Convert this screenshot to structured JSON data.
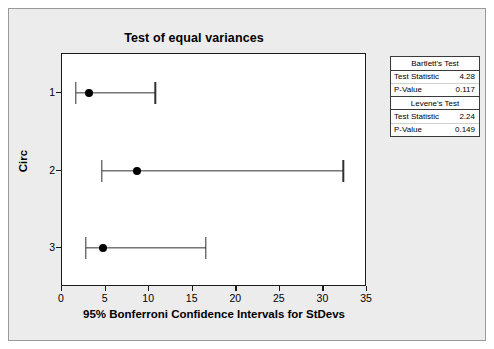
{
  "figure": {
    "title": "Test of equal variances",
    "background_color": "#ececec",
    "plot_background_color": "#ffffff"
  },
  "axes": {
    "x_title": "95% Bonferroni Confidence Intervals for StDevs",
    "y_title": "Circ",
    "x_ticks": [
      "0",
      "5",
      "10",
      "15",
      "20",
      "25",
      "30",
      "35"
    ],
    "y_ticks": [
      "1",
      "2",
      "3"
    ]
  },
  "stats": {
    "bartlett": {
      "heading": "Bartlett's Test",
      "statistic_label": "Test Statistic",
      "statistic_value": "4.28",
      "pvalue_label": "P-Value",
      "pvalue_value": "0.117"
    },
    "levene": {
      "heading": "Levene's Test",
      "statistic_label": "Test Statistic",
      "statistic_value": "2.24",
      "pvalue_label": "P-Value",
      "pvalue_value": "0.149"
    }
  },
  "chart_data": {
    "type": "scatter",
    "subtype": "interval-plot-confidence-intervals",
    "title": "Test of equal variances",
    "xlabel": "95% Bonferroni Confidence Intervals for StDevs",
    "ylabel": "Circ",
    "xlim": [
      0,
      35
    ],
    "xticks": [
      0,
      5,
      10,
      15,
      20,
      25,
      30,
      35
    ],
    "grid": false,
    "legend": null,
    "categories": [
      "1",
      "2",
      "3"
    ],
    "series": [
      {
        "name": "95% Bonferroni CI for StDev",
        "points": [
          {
            "category": "1",
            "lower": 1.6,
            "center": 3.1,
            "upper": 10.7
          },
          {
            "category": "2",
            "lower": 4.6,
            "center": 8.6,
            "upper": 32.3
          },
          {
            "category": "3",
            "lower": 2.7,
            "center": 4.7,
            "upper": 16.5
          }
        ]
      }
    ],
    "annotations": [
      {
        "text": "Bartlett's Test",
        "statistic": 4.28,
        "p_value": 0.117
      },
      {
        "text": "Levene's Test",
        "statistic": 2.24,
        "p_value": 0.149
      }
    ]
  }
}
